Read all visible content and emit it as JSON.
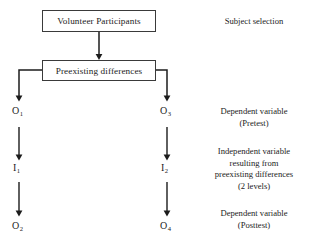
{
  "diagram": {
    "colors": {
      "background": "#ffffff",
      "stroke": "#1c1c1c",
      "box_border": "#3a3a3a",
      "text": "#1c1c1c"
    },
    "boxes": [
      {
        "id": "volunteer",
        "label": "Volunteer Participants"
      },
      {
        "id": "preexisting",
        "label": "Preexisting differences"
      }
    ],
    "columns": [
      {
        "id": "left-group",
        "nodes": [
          {
            "id": "o1",
            "letter": "O",
            "subscript": "1"
          },
          {
            "id": "i1",
            "letter": "I",
            "subscript": "1"
          },
          {
            "id": "o2",
            "letter": "O",
            "subscript": "2"
          }
        ]
      },
      {
        "id": "right-group",
        "nodes": [
          {
            "id": "o3",
            "letter": "O",
            "subscript": "3"
          },
          {
            "id": "i2",
            "letter": "I",
            "subscript": "2"
          },
          {
            "id": "o4",
            "letter": "O",
            "subscript": "4"
          }
        ]
      }
    ],
    "annotations": [
      {
        "id": "subject-selection",
        "text": "Subject selection"
      },
      {
        "id": "dependent-pretest",
        "text": "Dependent variable\n(Pretest)"
      },
      {
        "id": "independent-variable",
        "text": "Independent variable\nresulting from\npreexisting differences\n(2 levels)"
      },
      {
        "id": "dependent-posttest",
        "text": "Dependent variable\n(Posttest)"
      }
    ]
  }
}
